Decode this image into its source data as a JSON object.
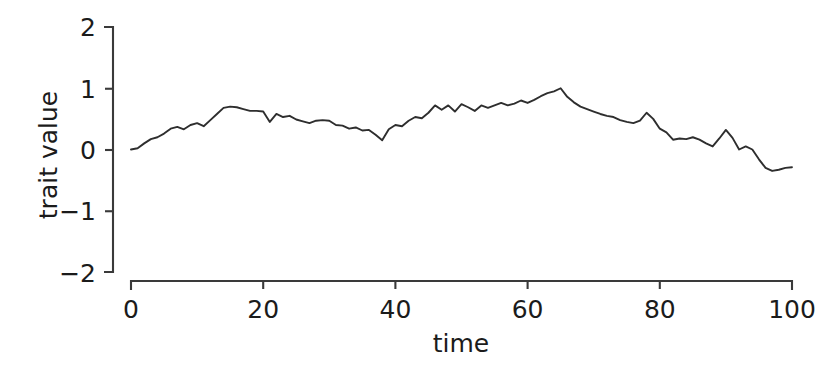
{
  "chart_data": {
    "type": "line",
    "title": "",
    "xlabel": "time",
    "ylabel": "trait value",
    "xlim": [
      0,
      100
    ],
    "ylim": [
      -2,
      2
    ],
    "xticks": [
      0,
      20,
      40,
      60,
      80,
      100
    ],
    "yticks": [
      -2,
      -1,
      0,
      1,
      2
    ],
    "xtick_labels": [
      "0",
      "20",
      "40",
      "60",
      "80",
      "100"
    ],
    "ytick_labels": [
      "−2",
      "−1",
      "0",
      "1",
      "2"
    ],
    "grid": false,
    "legend": null,
    "series": [
      {
        "name": "trait value",
        "color": "#2e2e2e",
        "x": [
          0,
          1,
          2,
          3,
          4,
          5,
          6,
          7,
          8,
          9,
          10,
          11,
          12,
          13,
          14,
          15,
          16,
          17,
          18,
          19,
          20,
          21,
          22,
          23,
          24,
          25,
          26,
          27,
          28,
          29,
          30,
          31,
          32,
          33,
          34,
          35,
          36,
          37,
          38,
          39,
          40,
          41,
          42,
          43,
          44,
          45,
          46,
          47,
          48,
          49,
          50,
          51,
          52,
          53,
          54,
          55,
          56,
          57,
          58,
          59,
          60,
          61,
          62,
          63,
          64,
          65,
          66,
          67,
          68,
          69,
          70,
          71,
          72,
          73,
          74,
          75,
          76,
          77,
          78,
          79,
          80,
          81,
          82,
          83,
          84,
          85,
          86,
          87,
          88,
          89,
          90,
          91,
          92,
          93,
          94,
          95,
          96,
          97,
          98,
          99,
          100
        ],
        "values": [
          0.0,
          0.02,
          0.1,
          0.17,
          0.2,
          0.26,
          0.34,
          0.37,
          0.33,
          0.4,
          0.43,
          0.38,
          0.48,
          0.58,
          0.68,
          0.7,
          0.69,
          0.66,
          0.63,
          0.63,
          0.62,
          0.45,
          0.58,
          0.53,
          0.55,
          0.49,
          0.46,
          0.43,
          0.47,
          0.48,
          0.47,
          0.4,
          0.39,
          0.34,
          0.36,
          0.31,
          0.32,
          0.24,
          0.15,
          0.33,
          0.4,
          0.38,
          0.47,
          0.53,
          0.51,
          0.6,
          0.72,
          0.65,
          0.72,
          0.62,
          0.74,
          0.69,
          0.63,
          0.72,
          0.68,
          0.72,
          0.76,
          0.72,
          0.75,
          0.8,
          0.76,
          0.81,
          0.87,
          0.92,
          0.95,
          1.0,
          0.86,
          0.77,
          0.7,
          0.66,
          0.62,
          0.58,
          0.55,
          0.53,
          0.48,
          0.45,
          0.43,
          0.47,
          0.6,
          0.5,
          0.34,
          0.28,
          0.16,
          0.18,
          0.17,
          0.2,
          0.16,
          0.1,
          0.05,
          0.18,
          0.32,
          0.19,
          0.0,
          0.05,
          0.0,
          -0.16,
          -0.3,
          -0.35,
          -0.33,
          -0.3,
          -0.29
        ]
      }
    ]
  },
  "axes": {
    "y_label": "trait value",
    "x_label": "time"
  }
}
